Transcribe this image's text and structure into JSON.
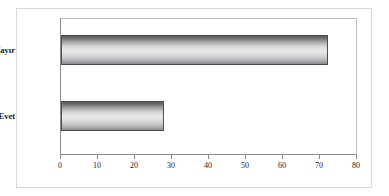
{
  "chart_data": {
    "type": "bar",
    "orientation": "horizontal",
    "title": "",
    "subtitle": "",
    "xlabel": "",
    "ylabel": "",
    "categories": [
      "Evet",
      "Hayır"
    ],
    "values": [
      27.8,
      72.2
    ],
    "series": [
      {
        "name": "",
        "values": [
          27.8,
          72.2
        ]
      }
    ],
    "xlim": [
      0,
      80
    ],
    "ylim": null,
    "xticks": [
      0,
      10,
      20,
      30,
      40,
      50,
      60,
      70,
      80
    ],
    "xtick_labels": [
      "0",
      "10",
      "20",
      "30",
      "40",
      "50",
      "60",
      "70",
      "80"
    ],
    "ytick_labels": [
      "Evet",
      "Hayır"
    ],
    "grid": false,
    "legend": false,
    "legend_position": "none",
    "annotations": [],
    "colors": {
      "bar_fill_light": "#e9e9e9",
      "bar_fill_dark": "#58585a",
      "bar_border": "#4d4d4d",
      "axis": "#8c8c8c",
      "plot_border": "#bfbfbf",
      "outer_border": "#d9d9d9",
      "background": "#ffffff",
      "text": "#1a1a1a"
    }
  }
}
